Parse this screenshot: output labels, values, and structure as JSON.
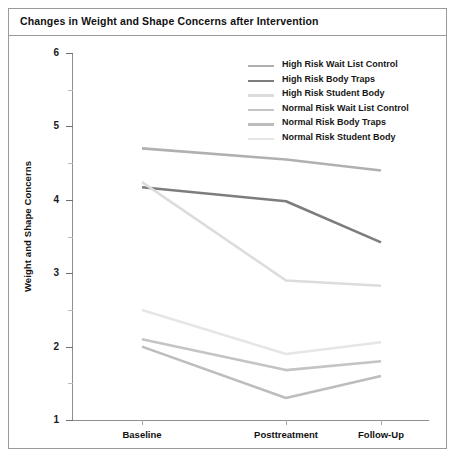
{
  "figure": {
    "title": "Changes in Weight and Shape Concerns after Intervention"
  },
  "axes": {
    "y_title": "Weight and Shape Concerns",
    "y_ticks": [
      "6",
      "5",
      "4",
      "3",
      "2",
      "1"
    ],
    "y_tick_values": [
      6,
      5,
      4,
      3,
      2,
      1
    ],
    "y_minor_values": [
      5.5,
      4.5,
      3.5,
      2.5,
      1.5
    ],
    "x_ticks": [
      "Baseline",
      "Posttreatment",
      "Follow-Up"
    ]
  },
  "legend": {
    "position": "top-right",
    "items": [
      {
        "label": "High Risk Wait List Control",
        "color": "#b0b0b0"
      },
      {
        "label": "High Risk Body Traps",
        "color": "#7d7d7d"
      },
      {
        "label": "High Risk Student Body",
        "color": "#dcdcdc"
      },
      {
        "label": "Normal Risk Wait List Control",
        "color": "#c4c4c4"
      },
      {
        "label": "Normal Risk Body Traps",
        "color": "#bdbdbd"
      },
      {
        "label": "Normal Risk Student Body",
        "color": "#e6e6e6"
      }
    ]
  },
  "chart_data": {
    "type": "line",
    "title": "Changes in Weight and Shape Concerns after Intervention",
    "xlabel": "",
    "ylabel": "Weight and Shape Concerns",
    "categories": [
      "Baseline",
      "Posttreatment",
      "Follow-Up"
    ],
    "ylim": [
      1,
      6
    ],
    "ytick_step": 1,
    "yminor_step": 0.5,
    "grid": false,
    "legend": "top-right",
    "series": [
      {
        "name": "High Risk Wait List Control",
        "color": "#b0b0b0",
        "values": [
          4.7,
          4.55,
          4.4
        ]
      },
      {
        "name": "High Risk Body Traps",
        "color": "#7d7d7d",
        "values": [
          4.17,
          3.98,
          3.42
        ]
      },
      {
        "name": "High Risk Student Body",
        "color": "#dcdcdc",
        "values": [
          4.24,
          2.9,
          2.83
        ]
      },
      {
        "name": "Normal Risk Wait List Control",
        "color": "#c4c4c4",
        "values": [
          2.1,
          1.68,
          1.8
        ]
      },
      {
        "name": "Normal Risk Body Traps",
        "color": "#bdbdbd",
        "values": [
          2.0,
          1.3,
          1.6
        ]
      },
      {
        "name": "Normal Risk Student Body",
        "color": "#e6e6e6",
        "values": [
          2.5,
          1.9,
          2.06
        ]
      }
    ]
  }
}
